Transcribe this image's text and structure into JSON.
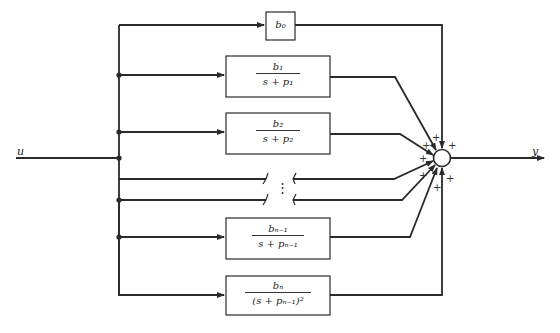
{
  "diagram": {
    "type": "parallel partial-fraction block diagram",
    "input_label": "u",
    "output_label": "y",
    "ellipsis": "⋮",
    "blocks": [
      {
        "id": "b0",
        "numerator": "b₀",
        "denominator": ""
      },
      {
        "id": "b1",
        "numerator": "b₁",
        "denominator": "s + p₁"
      },
      {
        "id": "b2",
        "numerator": "b₂",
        "denominator": "s + p₂"
      },
      {
        "id": "bn-1",
        "numerator": "bₙ₋₁",
        "denominator": "s + pₙ₋₁"
      },
      {
        "id": "bn",
        "numerator": "bₙ",
        "denominator": "(s + pₙ₋₁)²"
      }
    ],
    "summing_junction": {
      "signs": [
        "+",
        "+",
        "+",
        "+",
        "+",
        "+",
        "+"
      ]
    },
    "line_color": "#2a2a2a",
    "background": "#ffffff"
  }
}
